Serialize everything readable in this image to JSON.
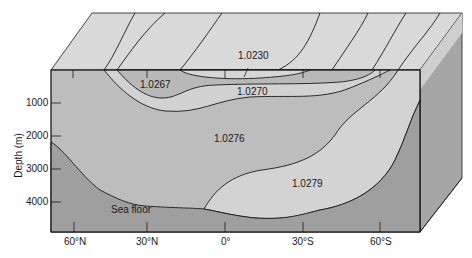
{
  "diagram": {
    "type": "oceanic-density-cross-section-block",
    "colors": {
      "top_face": "#d9d9d9",
      "low_density_surface": "#d6d6d6",
      "density_1_0267_band": "#b9b9b9",
      "density_1_0270_band": "#d2d2d2",
      "density_1_0276_water": "#bdbdbd",
      "density_1_0279_water": "#d3d3d3",
      "sea_floor": "#9f9f9f",
      "side_face": "#a6a6a6",
      "outline": "#1a1a1a"
    },
    "y_axis": {
      "label": "Depth (m)",
      "ticks": [
        "1000",
        "2000",
        "3000",
        "4000"
      ]
    },
    "x_axis": {
      "ticks": [
        "60°N",
        "30°N",
        "0°",
        "30°S",
        "60°S"
      ]
    },
    "regions": [
      {
        "label": "1.0230"
      },
      {
        "label": "1.0267"
      },
      {
        "label": "1.0270"
      },
      {
        "label": "1.0276"
      },
      {
        "label": "1.0279"
      },
      {
        "label": "Sea floor"
      }
    ]
  }
}
